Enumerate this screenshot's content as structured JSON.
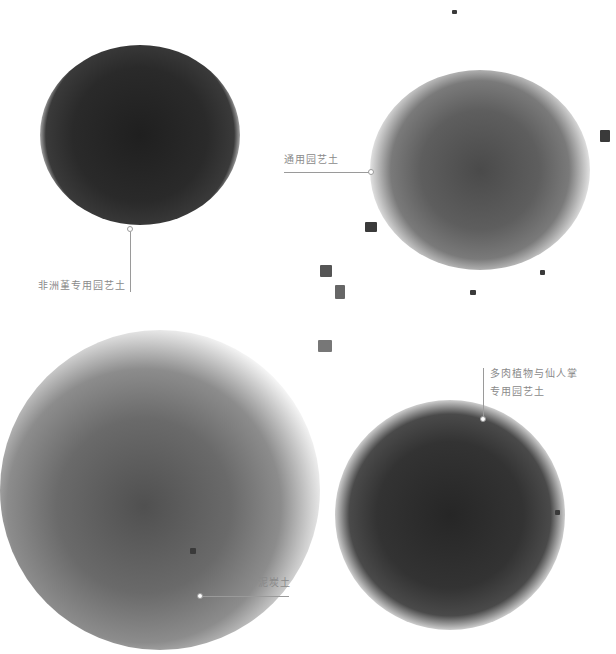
{
  "labels": {
    "african_violet": "非洲堇专用园艺土",
    "general": "通用园艺土",
    "succulent_line1": "多肉植物与仙人掌",
    "succulent_line2": "专用园艺土",
    "peat": "泥炭土"
  },
  "colors": {
    "background": "#ffffff",
    "soil_dark": "#2b2b2b",
    "soil_mid": "#555555",
    "soil_light": "#7a7a7a",
    "label_text": "#8a8a8a",
    "leader_line": "#9a9a9a"
  }
}
